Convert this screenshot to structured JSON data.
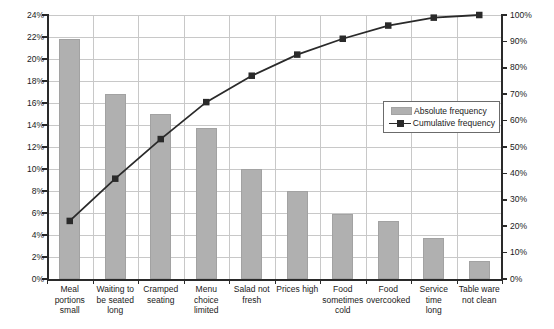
{
  "chart_data": {
    "type": "bar",
    "title": "",
    "subtitle": "",
    "xlabel": "",
    "ylabel": "",
    "grid": true,
    "legend_position": "inside-right",
    "categories": [
      "Meal portions small",
      "Waiting to be seated long",
      "Cramped seating",
      "Menu choice limited",
      "Salad not fresh",
      "Prices high",
      "Food sometimes cold",
      "Food overcooked",
      "Service time long",
      "Table ware not clean"
    ],
    "category_lines": [
      [
        "Meal",
        "portions",
        "small"
      ],
      [
        "Waiting to",
        "be seated",
        "long"
      ],
      [
        "Cramped",
        "seating"
      ],
      [
        "Menu",
        "choice",
        "limited"
      ],
      [
        "Salad not",
        "fresh"
      ],
      [
        "Prices high"
      ],
      [
        "Food",
        "sometimes",
        "cold"
      ],
      [
        "Food",
        "overcooked"
      ],
      [
        "Service time",
        "long"
      ],
      [
        "Table ware",
        "not clean"
      ]
    ],
    "series": [
      {
        "name": "Absolute frequency",
        "axis": "left",
        "type": "bar",
        "color": "#b0b0b0",
        "values": [
          21.8,
          16.8,
          15.0,
          13.7,
          10.0,
          8.0,
          5.9,
          5.3,
          3.7,
          1.6
        ]
      },
      {
        "name": "Cumulative frequency",
        "axis": "right",
        "type": "line",
        "color": "#2a2a2a",
        "values": [
          22,
          38,
          53,
          67,
          77,
          85,
          91,
          96,
          99,
          100
        ]
      }
    ],
    "ylim_left": [
      0,
      24
    ],
    "ylim_right": [
      0,
      100
    ],
    "yticks_left": [
      "0%",
      "2%",
      "4%",
      "6%",
      "8%",
      "10%",
      "12%",
      "14%",
      "16%",
      "18%",
      "20%",
      "22%",
      "24%"
    ],
    "yticks_right": [
      "0%",
      "10%",
      "20%",
      "30%",
      "40%",
      "50%",
      "60%",
      "70%",
      "80%",
      "90%",
      "100%"
    ],
    "ytick_values_left": [
      0,
      2,
      4,
      6,
      8,
      10,
      12,
      14,
      16,
      18,
      20,
      22,
      24
    ],
    "ytick_values_right": [
      0,
      10,
      20,
      30,
      40,
      50,
      60,
      70,
      80,
      90,
      100
    ]
  },
  "legend": {
    "items": [
      {
        "label": "Absolute frequency",
        "marker": "bar-swatch",
        "color": "#b0b0b0"
      },
      {
        "label": "Cumulative frequency",
        "marker": "line-square-marker",
        "color": "#2a2a2a"
      }
    ]
  },
  "colors": {
    "bar_fill": "#b0b0b0",
    "bar_stroke": "#a2a2a2",
    "line": "#2a2a2a",
    "grid": "#c8c8c8",
    "axis": "#2a2a2a",
    "background": "#ffffff",
    "text": "#1a1a1a"
  }
}
